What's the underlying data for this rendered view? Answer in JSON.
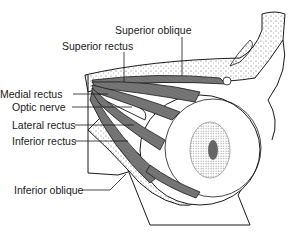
{
  "diagram": {
    "labels": [
      {
        "id": "superior-oblique",
        "text": "Superior oblique"
      },
      {
        "id": "superior-rectus",
        "text": "Superior rectus"
      },
      {
        "id": "medial-rectus",
        "text": "Medial rectus"
      },
      {
        "id": "optic-nerve",
        "text": "Optic nerve"
      },
      {
        "id": "lateral-rectus",
        "text": "Lateral rectus"
      },
      {
        "id": "inferior-rectus",
        "text": "Inferior rectus"
      },
      {
        "id": "inferior-oblique",
        "text": "Inferior oblique"
      }
    ],
    "colors": {
      "ink": "#1a1a1a",
      "muscle": "#6e6e6e",
      "bone_stipple": "#555555",
      "background": "#ffffff"
    }
  }
}
